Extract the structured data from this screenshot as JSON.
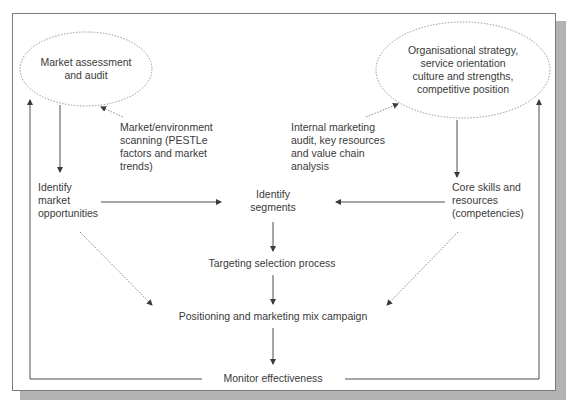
{
  "diagram": {
    "nodes": {
      "market_assessment": "Market assessment\nand audit",
      "market_assessment_lines": [
        "Market assessment",
        "and audit"
      ],
      "org_strategy_lines": [
        "Organisational strategy,",
        "service orientation",
        "culture and strengths,",
        "competitive position"
      ],
      "market_scanning_lines": [
        "Market/environment",
        "scanning (PESTLe",
        "factors and market",
        "trends)"
      ],
      "internal_audit_lines": [
        "Internal marketing",
        "audit, key resources",
        "and value chain",
        "analysis"
      ],
      "identify_opportunities_lines": [
        "Identify",
        "market",
        "opportunities"
      ],
      "identify_segments_lines": [
        "Identify",
        "segments"
      ],
      "core_skills_lines": [
        "Core skills and",
        "resources",
        "(competencies)"
      ],
      "targeting": "Targeting selection process",
      "positioning": "Positioning and marketing mix campaign",
      "monitor": "Monitor effectiveness"
    },
    "edges": [
      {
        "from": "Market assessment and audit",
        "to": "Identify market opportunities",
        "style": "solid"
      },
      {
        "from": "Market/environment scanning",
        "to": "Market assessment and audit",
        "style": "dotted"
      },
      {
        "from": "Internal marketing audit",
        "to": "Organisational strategy",
        "style": "dotted"
      },
      {
        "from": "Organisational strategy",
        "to": "Core skills and resources",
        "style": "solid"
      },
      {
        "from": "Identify market opportunities",
        "to": "Identify segments",
        "style": "solid"
      },
      {
        "from": "Core skills and resources",
        "to": "Identify segments",
        "style": "solid"
      },
      {
        "from": "Identify segments",
        "to": "Targeting selection process",
        "style": "solid"
      },
      {
        "from": "Targeting selection process",
        "to": "Positioning and marketing mix campaign",
        "style": "solid"
      },
      {
        "from": "Identify market opportunities",
        "to": "Positioning and marketing mix campaign",
        "style": "dotted"
      },
      {
        "from": "Core skills and resources",
        "to": "Positioning and marketing mix campaign",
        "style": "dotted"
      },
      {
        "from": "Positioning and marketing mix campaign",
        "to": "Monitor effectiveness",
        "style": "solid"
      },
      {
        "from": "Monitor effectiveness",
        "to": "Market assessment and audit",
        "style": "solid"
      },
      {
        "from": "Monitor effectiveness",
        "to": "Organisational strategy",
        "style": "solid"
      }
    ],
    "colors": {
      "line": "#3a3a3a",
      "dotted": "#7a7a7a",
      "frame": "#7a7a7a",
      "shadow": "#b3b3b3"
    }
  }
}
